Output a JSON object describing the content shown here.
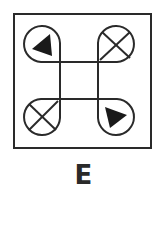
{
  "figure": {
    "label": "E",
    "stroke_color": "#2a2a2a",
    "background": "#ffffff",
    "frame": {
      "x": 14,
      "y": 14,
      "w": 137,
      "h": 134
    },
    "inner_square": {
      "x1": 60,
      "y1": 62,
      "x2": 98,
      "y2": 99
    },
    "teardrops": [
      {
        "position": "top-left",
        "symbol": "filled-triangle",
        "pointing": "up-left"
      },
      {
        "position": "top-right",
        "symbol": "x-cross"
      },
      {
        "position": "bottom-left",
        "symbol": "x-cross"
      },
      {
        "position": "bottom-right",
        "symbol": "filled-triangle",
        "pointing": "down-right"
      }
    ]
  }
}
